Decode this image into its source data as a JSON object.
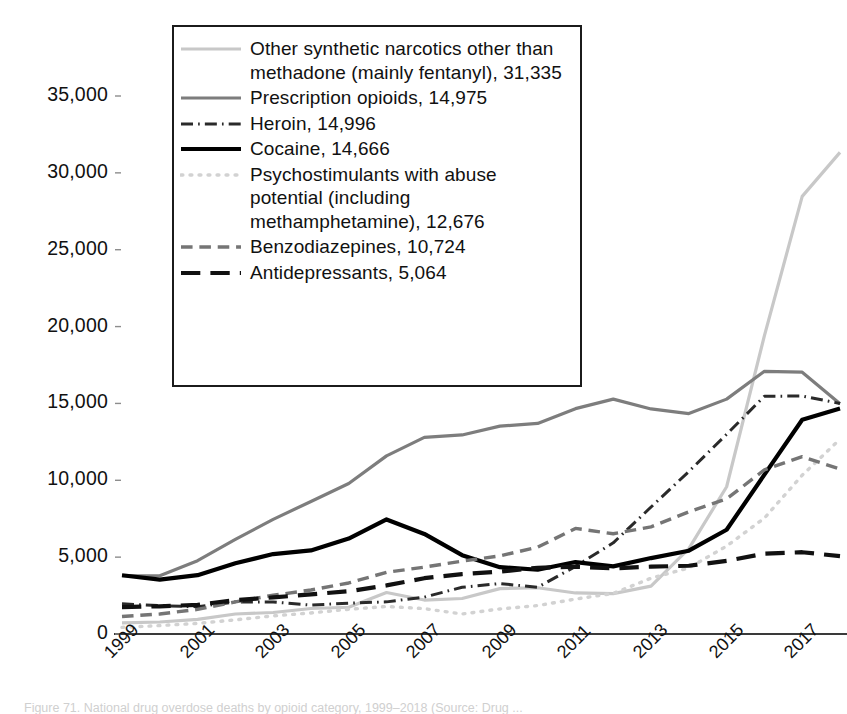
{
  "chart_data": {
    "type": "line",
    "title": "",
    "xlabel": "",
    "ylabel": "",
    "xlim": [
      1999,
      2018
    ],
    "ylim": [
      0,
      35000
    ],
    "ytick_values": [
      0,
      5000,
      10000,
      15000,
      20000,
      25000,
      30000,
      35000
    ],
    "ytick_labels": [
      "0",
      "5,000",
      "10,000",
      "15,000",
      "20,000",
      "25,000",
      "30,000",
      "35,000"
    ],
    "xtick_values": [
      1999,
      2001,
      2003,
      2005,
      2007,
      2009,
      2011,
      2013,
      2015,
      2017
    ],
    "xtick_labels": [
      "1999",
      "2001",
      "2003",
      "2005",
      "2007",
      "2009",
      "2011",
      "2013",
      "2015",
      "2017"
    ],
    "x": [
      1999,
      2000,
      2001,
      2002,
      2003,
      2004,
      2005,
      2006,
      2007,
      2008,
      2009,
      2010,
      2011,
      2012,
      2013,
      2014,
      2015,
      2016,
      2017,
      2018
    ],
    "grid": false,
    "legend_position": "upper-left-inset",
    "series": [
      {
        "name": "Other synthetic narcotics other than methadone (mainly fentanyl)",
        "final_value": 31335,
        "label": "Other synthetic narcotics other than methadone (mainly fentanyl), 31,335",
        "color": "#c8c8c8",
        "style": "solid",
        "width": 3.2,
        "values": [
          730,
          780,
          950,
          1300,
          1400,
          1660,
          1740,
          2700,
          2210,
          2310,
          2950,
          3010,
          2670,
          2630,
          3110,
          5550,
          9580,
          19410,
          28470,
          31335
        ]
      },
      {
        "name": "Prescription opioids",
        "final_value": 14975,
        "label": "Prescription opioids, 14,975",
        "color": "#7d7d7d",
        "style": "solid",
        "width": 3.2,
        "values": [
          3790,
          3790,
          4770,
          6150,
          7460,
          8620,
          9790,
          11590,
          12790,
          12950,
          13520,
          13700,
          14660,
          15280,
          14640,
          14340,
          15280,
          17090,
          17030,
          14975
        ]
      },
      {
        "name": "Heroin",
        "final_value": 14996,
        "label": "Heroin, 14,996",
        "color": "#2a2a2a",
        "style": "dashdot",
        "width": 3.0,
        "values": [
          1960,
          1840,
          1780,
          2090,
          2080,
          1880,
          2010,
          2090,
          2400,
          3040,
          3280,
          3040,
          4400,
          5930,
          8260,
          10570,
          12990,
          15470,
          15480,
          14996
        ]
      },
      {
        "name": "Cocaine",
        "final_value": 14666,
        "label": "Cocaine, 14,666",
        "color": "#000000",
        "style": "solid",
        "width": 4.2,
        "values": [
          3820,
          3540,
          3830,
          4600,
          5200,
          5440,
          6210,
          7450,
          6510,
          5130,
          4350,
          4180,
          4680,
          4400,
          4940,
          5420,
          6780,
          10370,
          13940,
          14666
        ]
      },
      {
        "name": "Psychostimulants with abuse potential (including methamphetamine)",
        "final_value": 12676,
        "label": "Psychostimulants with abuse potential (including methamphetamine), 12,676",
        "color": "#d2d2d2",
        "style": "dotted",
        "width": 3.4,
        "values": [
          430,
          550,
          690,
          920,
          1180,
          1370,
          1610,
          1790,
          1650,
          1300,
          1630,
          1850,
          2270,
          2640,
          3630,
          4300,
          5720,
          7540,
          10330,
          12676
        ]
      },
      {
        "name": "Benzodiazepines",
        "final_value": 10724,
        "label": "Benzodiazepines, 10,724",
        "color": "#757575",
        "style": "dashed",
        "width": 3.4,
        "values": [
          1140,
          1300,
          1600,
          2090,
          2520,
          2860,
          3320,
          4010,
          4350,
          4740,
          5080,
          5650,
          6870,
          6520,
          6970,
          7950,
          8790,
          10680,
          11540,
          10724
        ]
      },
      {
        "name": "Antidepressants",
        "final_value": 5064,
        "label": "Antidepressants, 5,064",
        "color": "#111111",
        "style": "dashed-long",
        "width": 4.2,
        "values": [
          1750,
          1800,
          1900,
          2200,
          2380,
          2580,
          2780,
          3160,
          3630,
          3900,
          4060,
          4310,
          4380,
          4270,
          4380,
          4440,
          4760,
          5230,
          5320,
          5064
        ]
      }
    ]
  },
  "legend": {
    "items": [
      {
        "label": "Other synthetic narcotics other than methadone (mainly fentanyl), 31,335",
        "icon": "line-swatch-solid-light-gray"
      },
      {
        "label": "Prescription opioids, 14,975",
        "icon": "line-swatch-solid-gray"
      },
      {
        "label": "Heroin, 14,996",
        "icon": "line-swatch-dashdot-dark"
      },
      {
        "label": "Cocaine, 14,666",
        "icon": "line-swatch-solid-black"
      },
      {
        "label": "Psychostimulants with abuse potential (including methamphetamine), 12,676",
        "icon": "line-swatch-dotted-light"
      },
      {
        "label": "Benzodiazepines, 10,724",
        "icon": "line-swatch-dashed-gray"
      },
      {
        "label": "Antidepressants, 5,064",
        "icon": "line-swatch-dashed-black"
      }
    ]
  },
  "caption": {
    "text": "Figure 71. National drug overdose deaths by opioid category, 1999–2018 (Source: Drug ..."
  }
}
